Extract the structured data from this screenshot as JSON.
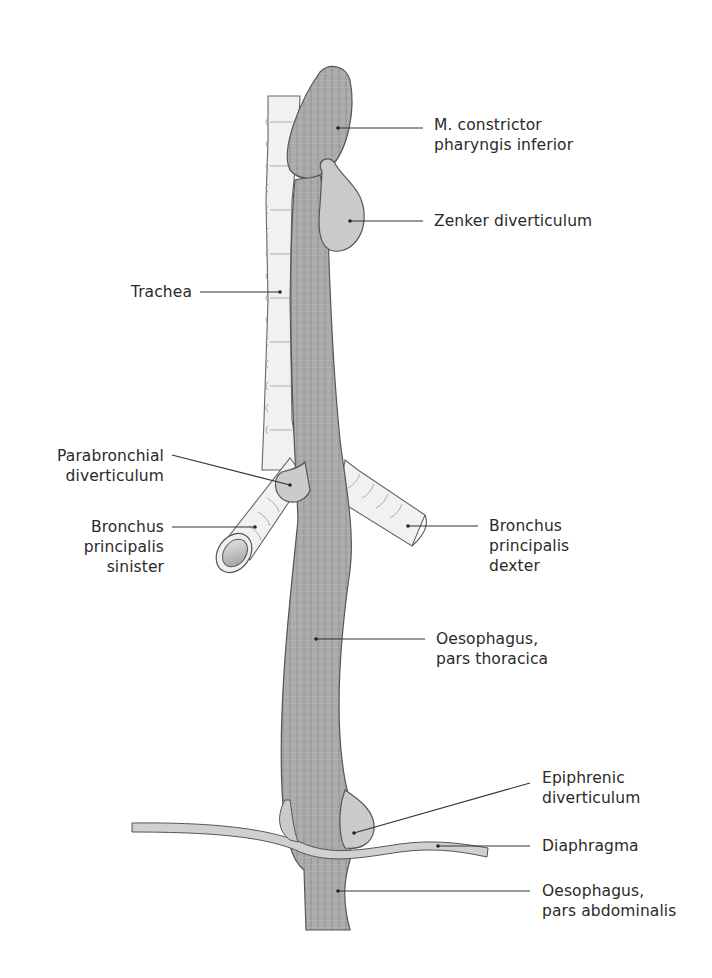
{
  "figure": {
    "type": "anatomical-diagram",
    "colors": {
      "muscle_fill": "#a9a9a9",
      "muscle_stripe": "#8f8f8f",
      "diverticulum_fill": "#c9c9c9",
      "trachea_fill": "#f1f1f1",
      "outline": "#555555",
      "leader_line": "#333333",
      "text": "#2a2a2a"
    }
  },
  "labels": {
    "constrictor": "M. constrictor\npharyngis inferior",
    "zenker": "Zenker diverticulum",
    "trachea": "Trachea",
    "parabronchial": "Parabronchial\ndiverticulum",
    "bronchus_sinister": "Bronchus\nprincipalis\nsinister",
    "bronchus_dexter": "Bronchus\nprincipalis\ndexter",
    "oesophagus_thoracica": "Oesophagus,\npars thoracica",
    "epiphrenic": "Epiphrenic\ndiverticulum",
    "diaphragma": "Diaphragma",
    "oesophagus_abdominalis": "Oesophagus,\npars abdominalis"
  }
}
